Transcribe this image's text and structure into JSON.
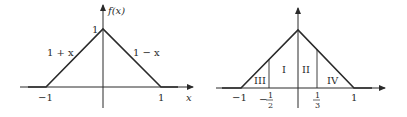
{
  "figures": [
    {
      "name": "triangle-function",
      "y_axis_label": "f(x)",
      "x_axis_label": "x",
      "peak_label": "1",
      "left_piece_label": "1 + x",
      "right_piece_label": "1 − x",
      "tick_left": "−1",
      "tick_right": "1"
    },
    {
      "name": "triangle-regions",
      "tick_left": "−1",
      "tick_right": "1",
      "tick_neg_half_sign": "−",
      "tick_neg_half_num": "1",
      "tick_neg_half_den": "2",
      "tick_third_num": "1",
      "tick_third_den": "3",
      "regions": [
        "III",
        "I",
        "II",
        "IV"
      ]
    }
  ],
  "colors": {
    "line": "#2a2a2a",
    "background": "#ffffff"
  }
}
